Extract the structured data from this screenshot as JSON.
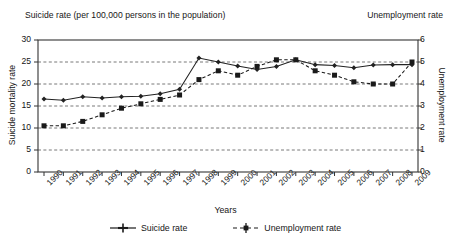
{
  "chart_data": {
    "type": "line",
    "title": "Suicide rate (per 100,000 persons in the population)",
    "title_right": "Unemployment rate",
    "xlabel": "Years",
    "ylabel": "Suicide mortality rate",
    "ylabel_right": "Unemployment rate",
    "grid": true,
    "legend_position": "bottom",
    "x": [
      1990,
      1991,
      1992,
      1993,
      1994,
      1995,
      1996,
      1997,
      1998,
      1999,
      2000,
      2001,
      2002,
      2003,
      2004,
      2005,
      2006,
      2007,
      2008,
      2009
    ],
    "categories": [
      "1990",
      "1991",
      "1992",
      "1993",
      "1994",
      "1995",
      "1996",
      "1997",
      "1998",
      "1999",
      "2000",
      "2001",
      "2002",
      "2003",
      "2004",
      "2005",
      "2006",
      "2007",
      "2008",
      "2009"
    ],
    "ylim": [
      0,
      30
    ],
    "yticks": [
      0,
      5,
      10,
      15,
      20,
      25,
      30
    ],
    "ylim_right": [
      0,
      6
    ],
    "yticks_right": [
      0,
      1,
      2,
      3,
      4,
      5,
      6
    ],
    "series": [
      {
        "name": "Suicide rate",
        "axis": "left",
        "marker": "plus-diamond",
        "linestyle": "solid",
        "color": "#222222",
        "values": [
          16.6,
          16.3,
          17.1,
          16.8,
          17.1,
          17.2,
          17.8,
          18.8,
          25.9,
          25.0,
          24.1,
          23.3,
          24.0,
          25.5,
          24.4,
          24.2,
          23.7,
          24.3,
          24.4,
          24.4
        ]
      },
      {
        "name": "Unemployment rate",
        "axis": "right",
        "marker": "square",
        "linestyle": "dashed",
        "color": "#1a1a1a",
        "values": [
          2.1,
          2.1,
          2.3,
          2.6,
          2.9,
          3.1,
          3.3,
          3.5,
          4.2,
          4.6,
          4.4,
          4.8,
          5.1,
          5.1,
          4.6,
          4.4,
          4.1,
          4.0,
          4.0,
          5.0
        ]
      }
    ]
  },
  "legend": {
    "items": [
      {
        "label": "Suicide rate",
        "marker": "plus",
        "line": "solid"
      },
      {
        "label": "Unemployment rate",
        "marker": "square",
        "line": "dashed"
      }
    ]
  },
  "colors": {
    "ink": "#1a1a1a",
    "axis": "#333333",
    "grid": "#555555",
    "background": "#ffffff"
  }
}
